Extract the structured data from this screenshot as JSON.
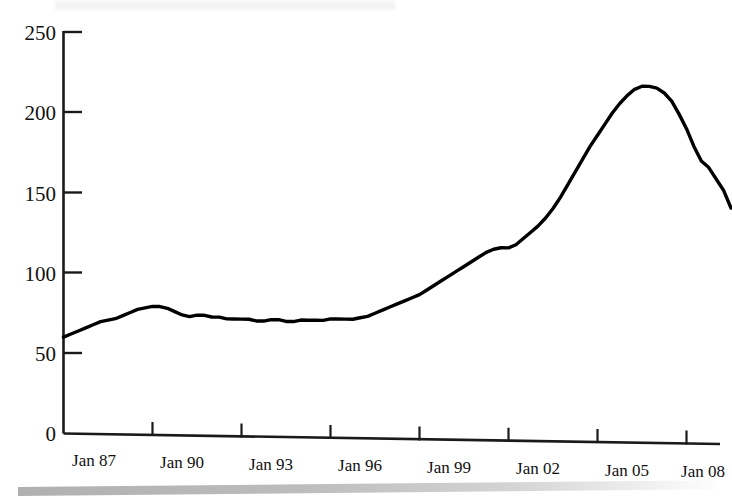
{
  "chart_data": {
    "type": "line",
    "title": "",
    "subtitle": "",
    "xlabel": "",
    "ylabel": "",
    "ylim": [
      0,
      250
    ],
    "yticks": [
      0,
      50,
      100,
      150,
      200,
      250
    ],
    "ytick_labels": [
      "0",
      "50",
      "100",
      "150",
      "200",
      "250"
    ],
    "xtick_labels": [
      "Jan 87",
      "Jan 90",
      "Jan 93",
      "Jan 96",
      "Jan 99",
      "Jan 02",
      "Jan 05",
      "Jan 08"
    ],
    "x_start_year": 1987,
    "x_end_year": 2009,
    "grid": false,
    "legend": false,
    "line_color": "#000000",
    "series": [
      {
        "name": "Index",
        "x": [
          1987.0,
          1987.25,
          1987.5,
          1987.75,
          1988.0,
          1988.25,
          1988.5,
          1988.75,
          1989.0,
          1989.25,
          1989.5,
          1989.75,
          1990.0,
          1990.25,
          1990.5,
          1990.75,
          1991.0,
          1991.25,
          1991.5,
          1991.75,
          1992.0,
          1992.25,
          1992.5,
          1992.75,
          1993.0,
          1993.25,
          1993.5,
          1993.75,
          1994.0,
          1994.25,
          1994.5,
          1994.75,
          1995.0,
          1995.25,
          1995.5,
          1995.75,
          1996.0,
          1996.25,
          1996.5,
          1996.75,
          1997.0,
          1997.25,
          1997.5,
          1997.75,
          1998.0,
          1998.25,
          1998.5,
          1998.75,
          1999.0,
          1999.25,
          1999.5,
          1999.75,
          2000.0,
          2000.25,
          2000.5,
          2000.75,
          2001.0,
          2001.25,
          2001.5,
          2001.75,
          2002.0,
          2002.25,
          2002.5,
          2002.75,
          2003.0,
          2003.25,
          2003.5,
          2003.75,
          2004.0,
          2004.25,
          2004.5,
          2004.75,
          2005.0,
          2005.25,
          2005.5,
          2005.75,
          2006.0,
          2006.25,
          2006.5,
          2006.75,
          2007.0,
          2007.25,
          2007.5,
          2007.75,
          2008.0,
          2008.25,
          2008.5,
          2008.75
        ],
        "values": [
          60,
          62,
          64,
          66,
          68,
          70,
          71,
          72,
          74,
          76,
          78,
          79,
          80,
          80,
          79,
          77,
          75,
          74,
          75,
          75,
          74,
          74,
          73,
          73,
          73,
          73,
          72,
          72,
          73,
          73,
          72,
          72,
          73,
          73,
          73,
          73,
          74,
          74,
          74,
          74,
          75,
          76,
          78,
          80,
          82,
          84,
          86,
          88,
          90,
          93,
          96,
          99,
          102,
          105,
          108,
          111,
          114,
          117,
          119,
          120,
          120,
          122,
          126,
          130,
          134,
          139,
          145,
          152,
          160,
          168,
          176,
          184,
          191,
          198,
          205,
          211,
          216,
          220,
          222,
          222,
          221,
          218,
          213,
          205,
          196,
          185,
          176,
          172
        ],
        "late_values": [
          165,
          158,
          147
        ],
        "peak_value": 222,
        "peak_year": "Jan 06",
        "start_value": 60,
        "end_value": 147
      }
    ]
  },
  "axes": {
    "y_axis_name": "y-axis",
    "x_axis_name": "x-axis"
  }
}
